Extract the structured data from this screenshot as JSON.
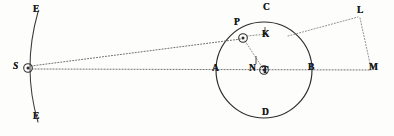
{
  "figure": {
    "type": "line-diagram",
    "width": 394,
    "height": 136,
    "background_color": "#fdfdfc",
    "ink_color": "#2b2b2b",
    "dotted_color": "#6f6f6f"
  },
  "labels": [
    {
      "id": "E_top",
      "text": "E",
      "x": 33,
      "y": 5,
      "style": "roman"
    },
    {
      "id": "E_bottom",
      "text": "E",
      "x": 33,
      "y": 112,
      "style": "roman"
    },
    {
      "id": "S",
      "text": "S",
      "x": 13,
      "y": 62,
      "style": "italic"
    },
    {
      "id": "P",
      "text": "P",
      "x": 234,
      "y": 18,
      "style": "roman"
    },
    {
      "id": "C",
      "text": "C",
      "x": 263,
      "y": 3,
      "style": "roman"
    },
    {
      "id": "K",
      "text": "K",
      "x": 262,
      "y": 30,
      "style": "roman"
    },
    {
      "id": "L",
      "text": "L",
      "x": 357,
      "y": 6,
      "style": "roman"
    },
    {
      "id": "A",
      "text": "A",
      "x": 212,
      "y": 64,
      "style": "roman"
    },
    {
      "id": "N",
      "text": "N",
      "x": 249,
      "y": 64,
      "style": "roman"
    },
    {
      "id": "T",
      "text": "T",
      "x": 262,
      "y": 66,
      "style": "roman"
    },
    {
      "id": "B",
      "text": "B",
      "x": 308,
      "y": 63,
      "style": "roman"
    },
    {
      "id": "M",
      "text": "M",
      "x": 369,
      "y": 63,
      "style": "roman"
    },
    {
      "id": "D",
      "text": "D",
      "x": 262,
      "y": 108,
      "style": "roman"
    }
  ],
  "points": [
    {
      "id": "S",
      "x": 28,
      "y": 68,
      "marker": "circled-dot"
    },
    {
      "id": "P",
      "x": 243,
      "y": 38,
      "marker": "circled-dot"
    },
    {
      "id": "T",
      "x": 264,
      "y": 70,
      "marker": "circled-dot"
    }
  ],
  "circle": {
    "id": "epicycle",
    "center_x": 264,
    "center_y": 70,
    "radius": 48,
    "stroke": "solid"
  },
  "arc": {
    "id": "deferent-arc",
    "from_x": 38,
    "from_y": 12,
    "to_x": 38,
    "to_y": 122,
    "through_x": 27,
    "through_y": 68,
    "stroke": "solid"
  },
  "lines": [
    {
      "id": "S-to-P",
      "from": "S",
      "to": "P",
      "style": "dotted"
    },
    {
      "id": "S-to-M",
      "from": "S",
      "to": "M",
      "style": "dotted"
    },
    {
      "id": "P-to-T",
      "from": "P",
      "to": "T",
      "style": "dotted"
    },
    {
      "id": "P-to-K",
      "from": "P",
      "to": "K",
      "style": "dotted"
    },
    {
      "id": "circle-to-L",
      "from": "circle-upper-right",
      "to": "L",
      "style": "dotted"
    },
    {
      "id": "L-to-M",
      "from": "L",
      "to": "M",
      "style": "dotted"
    }
  ],
  "ticks": [
    {
      "id": "K-tick",
      "x": 265,
      "y1": 28,
      "y2": 36
    },
    {
      "id": "N-tick",
      "x": 256,
      "y1": 57,
      "y2": 65
    }
  ]
}
